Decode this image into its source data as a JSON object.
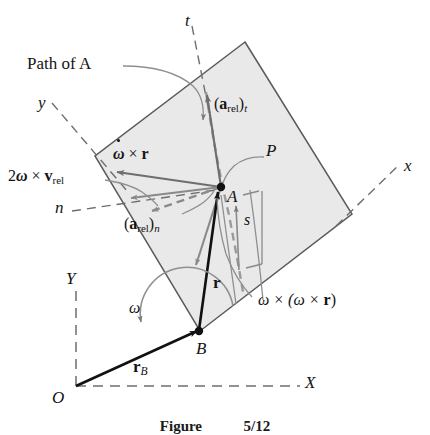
{
  "figure": {
    "caption_label": "Figure",
    "caption_number": "5/12",
    "body_fill": "#e9e9e9",
    "body_stroke": "#5a5a5a",
    "vector_color": "#6e6e6e",
    "dark_color": "#111111",
    "dashed_color": "#7a7a7a"
  },
  "labels": {
    "path_of_a": "Path of A",
    "t_axis": "t",
    "y_axis": "y",
    "n_axis": "n",
    "x_axis": "x",
    "X_axis": "X",
    "Y_axis": "Y",
    "origin": "O",
    "point_a": "A",
    "point_b": "B",
    "point_p": "P",
    "arc_s": "s",
    "omega": "ω"
  },
  "vectors": [
    {
      "name": "a-rel-t",
      "base": "a",
      "sub": "rel",
      "post": ")",
      "pre": "(",
      "post_sub": "t"
    },
    {
      "name": "a-rel-n",
      "base": "a",
      "sub": "rel",
      "post": ")",
      "pre": "(",
      "post_sub": "n"
    },
    {
      "name": "r",
      "text": "r"
    },
    {
      "name": "r-b",
      "base": "r",
      "post_sub": "B"
    }
  ],
  "expressions": {
    "a_rel_t_pre": "(",
    "a_rel_t_a": "a",
    "a_rel_t_rel": "rel",
    "a_rel_t_close": ")",
    "a_rel_t_t": "t",
    "a_rel_n_pre": "(",
    "a_rel_n_a": "a",
    "a_rel_n_rel": "rel",
    "a_rel_n_close": ")",
    "a_rel_n_n": "n",
    "omega_dot_cross_r_w": "ω",
    "omega_dot_cross_r_x": "×",
    "omega_dot_cross_r_r": "r",
    "coriolis_two": "2",
    "coriolis_w": "ω",
    "coriolis_x": "×",
    "coriolis_v": "v",
    "coriolis_rel": "rel",
    "centrip": "ω × (ω × ",
    "centrip_r": "r",
    "centrip_close": ")",
    "r_vec": "r",
    "rb_vec": "r",
    "rb_sub": "B"
  }
}
